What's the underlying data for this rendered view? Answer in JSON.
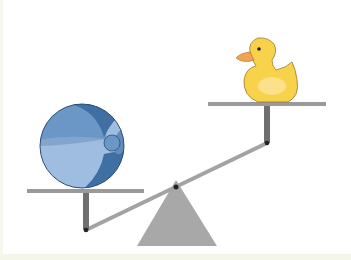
{
  "scene": {
    "description": "Seesaw balance with a beach ball on the lower left platform and a rubber duck on the raised right platform",
    "objects": [
      {
        "name": "beach-ball",
        "side": "left",
        "position": "low"
      },
      {
        "name": "rubber-duck",
        "side": "right",
        "position": "high"
      }
    ],
    "colors": {
      "background": "#ffffff",
      "frame": "#f3f6e8",
      "platform": "#9a9a9a",
      "post": "#6f6f6f",
      "beam": "#a3a3a3",
      "fulcrum": "#a8a8a8",
      "ball_dark": "#3f6fa3",
      "ball_mid": "#5f8dbf",
      "ball_light": "#9fbde0",
      "duck_body": "#f7d24a",
      "duck_highlight": "#fbe59a",
      "duck_beak": "#efa455"
    }
  }
}
